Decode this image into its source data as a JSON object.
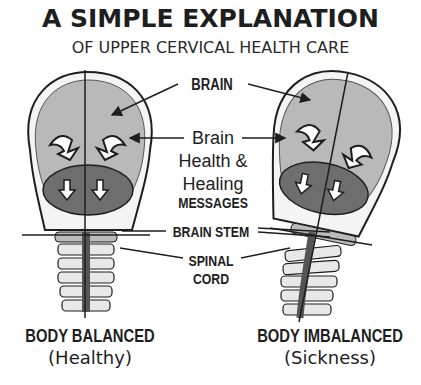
{
  "header": {
    "title": "A SIMPLE EXPLANATION",
    "subtitle": "OF UPPER CERVICAL HEALTH CARE"
  },
  "labels": {
    "brain": "BRAIN",
    "messages_line1": "Brain",
    "messages_line2": "Health &",
    "messages_line3": "Healing",
    "messages_line4": "MESSAGES",
    "brain_stem": "BRAIN STEM",
    "spinal_cord_line1": "SPINAL",
    "spinal_cord_line2": "CORD"
  },
  "panels": [
    {
      "caption": "BODY BALANCED",
      "sub_caption": "(Healthy)"
    },
    {
      "caption": "BODY IMBALANCED",
      "sub_caption": "(Sickness)"
    }
  ],
  "colors": {
    "skull_fill": "#f4f4f4",
    "brain_fill": "#b9b9b9",
    "cerebellum_fill": "#6e6e6e",
    "ink": "#1e1e1e"
  }
}
